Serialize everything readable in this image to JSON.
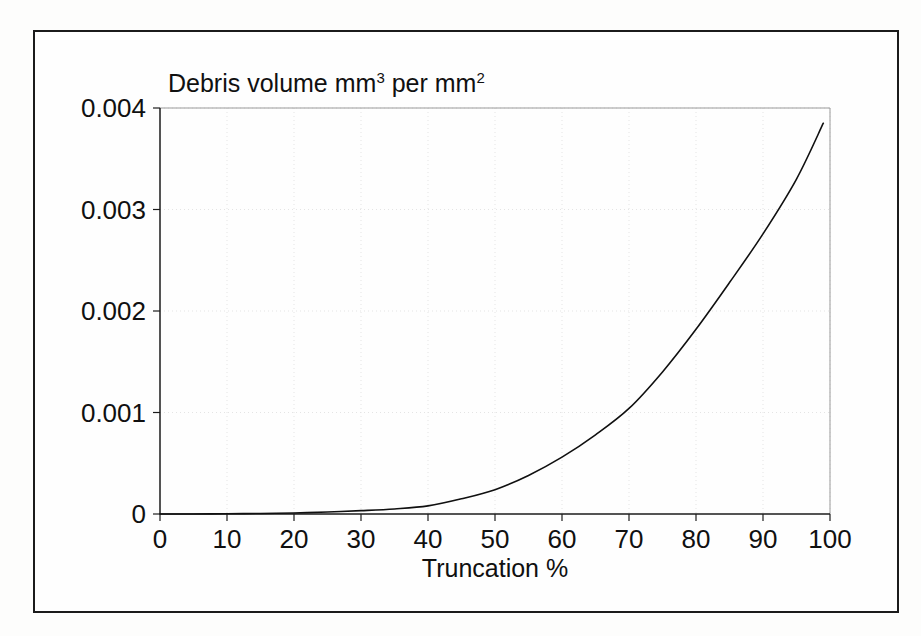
{
  "figure": {
    "background_color": "#fdfdfc",
    "frame_color": "#1b1b1b",
    "plot_background": "#ffffff"
  },
  "chart_data": {
    "type": "line",
    "title_parts": {
      "segment1": "Debris volume mm",
      "sup1": "3",
      "segment2": " per mm",
      "sup2": "2"
    },
    "xlabel": "Truncation %",
    "ylabel": "",
    "xlim": [
      0,
      100
    ],
    "ylim": [
      0,
      0.004
    ],
    "xticks": [
      0,
      10,
      20,
      30,
      40,
      50,
      60,
      70,
      80,
      90,
      100
    ],
    "xticklabels": [
      "0",
      "10",
      "20",
      "30",
      "40",
      "50",
      "60",
      "70",
      "80",
      "90",
      "100"
    ],
    "yticks": [
      0,
      0.001,
      0.002,
      0.003,
      0.004
    ],
    "yticklabels": [
      "0",
      "0.001",
      "0.002",
      "0.003",
      "0.004"
    ],
    "grid": "both-faint-dotted",
    "legend": null,
    "line_color": "#101010",
    "line_width": 1.6,
    "x": [
      0,
      5,
      10,
      15,
      20,
      25,
      30,
      35,
      40,
      45,
      50,
      55,
      60,
      65,
      70,
      75,
      80,
      85,
      90,
      95,
      99
    ],
    "values": [
      0.0,
      5e-07,
      2e-06,
      5e-06,
      1e-05,
      2e-05,
      3.3e-05,
      5e-05,
      8e-05,
      0.00015,
      0.00024,
      0.00038,
      0.00056,
      0.00078,
      0.00104,
      0.0014,
      0.00182,
      0.00228,
      0.00276,
      0.0033,
      0.00385
    ],
    "series": [
      {
        "name": "Debris volume",
        "values": [
          0.0,
          5e-07,
          2e-06,
          5e-06,
          1e-05,
          2e-05,
          3.3e-05,
          5e-05,
          8e-05,
          0.00015,
          0.00024,
          0.00038,
          0.00056,
          0.00078,
          0.00104,
          0.0014,
          0.00182,
          0.00228,
          0.00276,
          0.0033,
          0.00385
        ]
      }
    ],
    "annotations": []
  }
}
